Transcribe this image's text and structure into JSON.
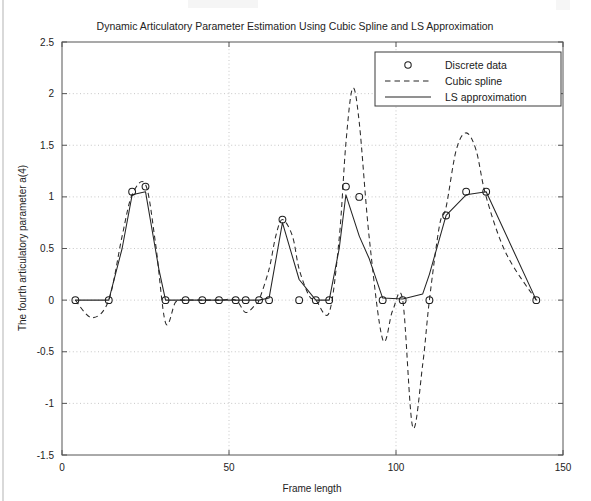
{
  "chart_data": {
    "type": "line",
    "title": "Dynamic Articulatory Parameter Estimation Using Cubic Spline and LS Approximation",
    "xlabel": "Frame length",
    "ylabel": "The fourth articulatory parameter a(4)",
    "xlim": [
      0,
      150
    ],
    "ylim": [
      -1.5,
      2.5
    ],
    "xticks": [
      0,
      50,
      100,
      150
    ],
    "xtick_labels": [
      "0",
      "50",
      "100",
      "150"
    ],
    "yticks": [
      -1.5,
      -1,
      -0.5,
      0,
      0.5,
      1,
      1.5,
      2,
      2.5
    ],
    "ytick_labels": [
      "-1.5",
      "-1",
      "-0.5",
      "0",
      "0.5",
      "1",
      "1.5",
      "2",
      "2.5"
    ],
    "grid": true,
    "legend_position": "upper right",
    "legend": [
      {
        "label": "Discrete data",
        "style": "marker-circle"
      },
      {
        "label": "Cubic spline",
        "style": "dashed-line"
      },
      {
        "label": "LS approximation",
        "style": "solid-line"
      }
    ],
    "series": [
      {
        "name": "Discrete data",
        "style": "marker-circle",
        "x": [
          4,
          14,
          21,
          25,
          31,
          37,
          42,
          47,
          52,
          55,
          59,
          62,
          66,
          71,
          76,
          80,
          85,
          89,
          96,
          102,
          110,
          115,
          121,
          127,
          142
        ],
        "y": [
          0,
          0,
          1.05,
          1.1,
          0,
          0,
          0,
          0,
          0,
          0,
          0,
          0,
          0.78,
          0,
          0,
          0,
          1.1,
          1.0,
          0,
          0,
          0,
          0.82,
          1.05,
          1.05,
          0
        ]
      },
      {
        "name": "Cubic spline",
        "style": "dashed-line",
        "x": [
          4,
          9,
          14,
          18,
          21,
          25,
          28,
          31,
          34,
          37,
          42,
          47,
          52,
          55,
          58,
          59,
          62,
          64,
          66,
          69,
          71,
          74,
          76,
          80,
          83,
          85,
          87,
          89,
          92,
          96,
          99,
          102,
          105,
          108,
          110,
          113,
          115,
          118,
          121,
          124,
          127,
          133,
          142
        ],
        "y": [
          0,
          -0.17,
          0,
          0.62,
          1.02,
          1.12,
          0.55,
          -0.22,
          -0.02,
          0,
          0,
          0,
          0,
          -0.12,
          -0.04,
          0,
          0.3,
          0.62,
          0.78,
          0.62,
          0.3,
          0.04,
          0,
          -0.12,
          0.6,
          1.52,
          2.05,
          1.72,
          0.6,
          -0.38,
          -0.1,
          0,
          -1.23,
          -0.62,
          0,
          0.72,
          0.9,
          1.45,
          1.62,
          1.45,
          1.0,
          0.45,
          0
        ]
      },
      {
        "name": "LS approximation",
        "style": "solid-line",
        "x": [
          4,
          14,
          18,
          21,
          25,
          29,
          31,
          37,
          42,
          47,
          52,
          55,
          59,
          62,
          66,
          71,
          76,
          80,
          83,
          85,
          89,
          92,
          96,
          102,
          108,
          110,
          115,
          121,
          127,
          142
        ],
        "y": [
          0,
          0,
          0.5,
          1.02,
          1.05,
          0.3,
          0,
          0,
          0,
          0,
          0,
          0,
          0,
          0.02,
          0.75,
          0.2,
          0,
          0,
          0.5,
          1.02,
          0.62,
          0.4,
          0.02,
          0.01,
          0.06,
          0.25,
          0.82,
          1.02,
          1.05,
          0
        ]
      }
    ]
  }
}
